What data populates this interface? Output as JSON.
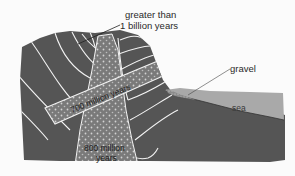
{
  "diagram": {
    "type": "geological-cross-section",
    "colors": {
      "background": "#fbfbfb",
      "rock": "#555555",
      "strata_lines": "#f2f2f2",
      "intrusion": "#7a7a7a",
      "intrusion_dots": "#cfcfcf",
      "sea": "#a9a9a9",
      "gravel": "#9a9a9a",
      "text": "#2a2a2a"
    },
    "labels": {
      "oldest_rock_line1": "greater than",
      "oldest_rock_line2": "1 billion years",
      "gravel": "gravel",
      "sea": "sea",
      "diagonal_dike": "700 million years",
      "vertical_dike_line1": "800 million",
      "vertical_dike_line2": "years"
    }
  }
}
